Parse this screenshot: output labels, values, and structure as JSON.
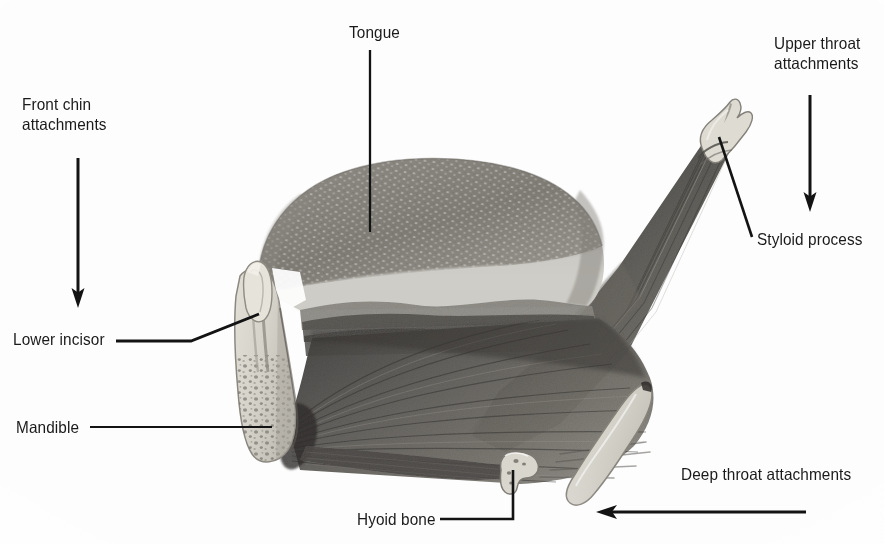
{
  "figure": {
    "background_color": "#fdfdfd",
    "ink_color": "#1a1a1a",
    "width": 884,
    "height": 544
  },
  "labels": {
    "front_chin_attachments": "Front chin\nattachments",
    "tongue": "Tongue",
    "upper_throat_attachments": "Upper throat\nattachments",
    "styloid_process": "Styloid process",
    "lower_incisor": "Lower incisor",
    "mandible": "Mandible",
    "hyoid_bone": "Hyoid bone",
    "deep_throat_attachments": "Deep throat attachments"
  },
  "annotations": {
    "front_chin_arrow": "down-arrow",
    "upper_throat_arrow": "down-arrow",
    "deep_throat_arrow": "left-arrow",
    "tongue_leader": "vertical-leader-line",
    "styloid_leader": "diagonal-leader-line",
    "lower_incisor_leader": "elbow-leader-line",
    "mandible_leader": "horizontal-leader-line",
    "hyoid_leader": "elbow-leader-line"
  },
  "structures": {
    "tongue_body": "tongue-dome",
    "genioglossus": "fan-shaped-muscle",
    "styloglossus": "diagonal-muscle-band",
    "mandible_bone": "mandible-cross-section",
    "lower_incisor_tooth": "incisor-tooth",
    "hyoid_body": "hyoid-bone-hook",
    "greater_cornu": "greater-cornu-bone",
    "styloid_tip": "styloid-process-bone"
  },
  "palette": {
    "bone_fill": "#d8d5cd",
    "bone_edge": "#8f8b81",
    "muscle_dark": "#4a4a4a",
    "muscle_mid": "#6f6f6f",
    "tongue_top": "#8e8b85",
    "tongue_under": "#c9c7c1"
  }
}
